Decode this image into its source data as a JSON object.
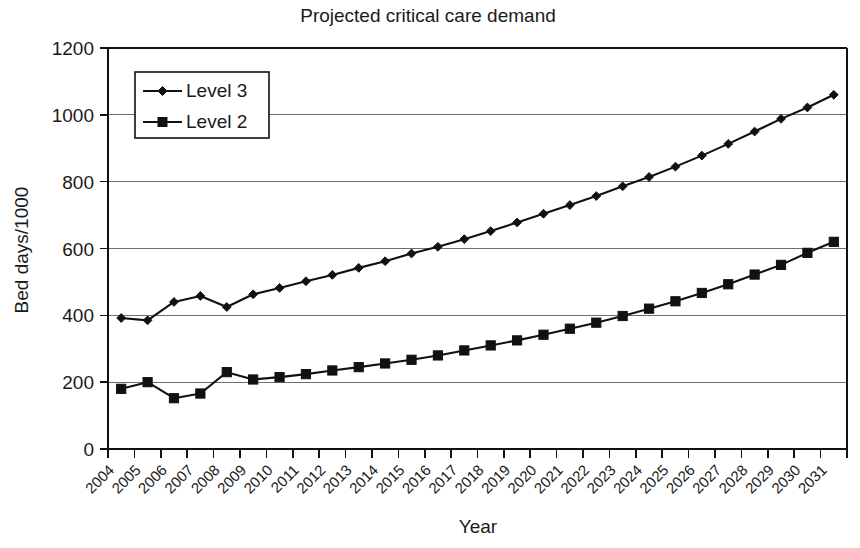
{
  "chart_data": {
    "type": "line",
    "title": "Projected critical care demand",
    "xlabel": "Year",
    "ylabel": "Bed days/1000",
    "x": [
      2004,
      2005,
      2006,
      2007,
      2008,
      2009,
      2010,
      2011,
      2012,
      2013,
      2014,
      2015,
      2016,
      2017,
      2018,
      2019,
      2020,
      2021,
      2022,
      2023,
      2024,
      2025,
      2026,
      2027,
      2028,
      2029,
      2030,
      2031
    ],
    "categories": [
      "2004",
      "2005",
      "2006",
      "2007",
      "2008",
      "2009",
      "2010",
      "2011",
      "2012",
      "2013",
      "2014",
      "2015",
      "2016",
      "2017",
      "2018",
      "2019",
      "2020",
      "2021",
      "2022",
      "2023",
      "2024",
      "2025",
      "2026",
      "2027",
      "2028",
      "2029",
      "2030",
      "2031"
    ],
    "series": [
      {
        "name": "Level 3",
        "marker": "diamond",
        "values": [
          392,
          385,
          440,
          458,
          425,
          463,
          482,
          502,
          521,
          542,
          562,
          585,
          605,
          628,
          652,
          678,
          704,
          730,
          757,
          786,
          814,
          845,
          878,
          913,
          950,
          988,
          1022,
          1060
        ]
      },
      {
        "name": "Level 2",
        "marker": "square",
        "values": [
          180,
          200,
          152,
          166,
          230,
          208,
          215,
          224,
          235,
          245,
          256,
          267,
          280,
          295,
          310,
          325,
          342,
          360,
          378,
          398,
          420,
          442,
          467,
          493,
          522,
          551,
          587,
          620
        ]
      }
    ],
    "ylim": [
      0,
      1200
    ],
    "ytick_values": [
      0,
      200,
      400,
      600,
      800,
      1000,
      1200
    ],
    "ytick_labels": [
      "0",
      "200",
      "400",
      "600",
      "800",
      "1000",
      "1200"
    ],
    "grid": "horizontal",
    "legend_position": "top-left-inside",
    "legend_entries": [
      "Level 3",
      "Level 2"
    ],
    "line_color": "#111111",
    "grid_color": "#6e6e6e",
    "background_color": "#ffffff"
  }
}
